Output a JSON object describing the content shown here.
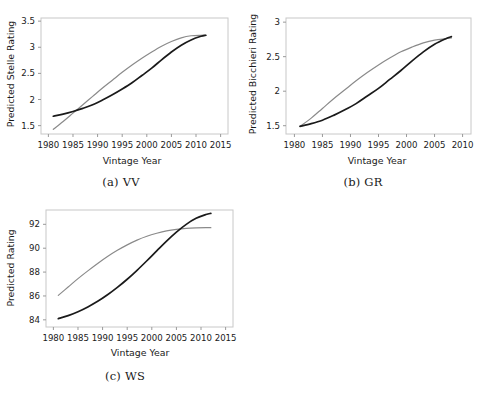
{
  "figure": {
    "panels": [
      {
        "id": "a",
        "caption": "(a) VV",
        "xlabel": "Vintage Year",
        "ylabel": "Predicted Stelle Rating"
      },
      {
        "id": "b",
        "caption": "(b) GR",
        "xlabel": "Vintage Year",
        "ylabel": "Predicted Bicchieri Rating"
      },
      {
        "id": "c",
        "caption": "(c) WS",
        "xlabel": "Vintage Year",
        "ylabel": "Predicted Rating"
      }
    ]
  },
  "colors": {
    "curve_dark": "#1a1a1a",
    "curve_gray": "#8a8a8a",
    "frame": "#c8c8c8",
    "text": "#1a1a1a",
    "background": "#ffffff"
  },
  "chart_data": [
    {
      "type": "line",
      "id": "a",
      "title": "(a) VV",
      "xlabel": "Vintage Year",
      "ylabel": "Predicted Stelle Rating",
      "xlim": [
        1978.5,
        2016.5
      ],
      "ylim": [
        1.34,
        3.56
      ],
      "xticks": [
        1980,
        1985,
        1990,
        1995,
        2000,
        2005,
        2010,
        2015
      ],
      "xticklabels": [
        "1980",
        "1985",
        "1990",
        "1995",
        "2000",
        "2005",
        "2010",
        "2015"
      ],
      "yticks": [
        1.5,
        2,
        2.5,
        3,
        3.5
      ],
      "yticklabels": [
        "1.5",
        "2",
        "2.5",
        "3",
        "3.5"
      ],
      "grid": false,
      "legend": "none",
      "series": [
        {
          "name": "gray-curve",
          "color": "#8a8a8a",
          "x": [
            1981,
            1983,
            1985,
            1987,
            1989,
            1991,
            1993,
            1995,
            1997,
            1999,
            2001,
            2003,
            2005,
            2007,
            2009,
            2011,
            2012
          ],
          "y": [
            1.43,
            1.58,
            1.74,
            1.9,
            2.06,
            2.22,
            2.37,
            2.52,
            2.66,
            2.79,
            2.91,
            3.02,
            3.11,
            3.18,
            3.22,
            3.23,
            3.23
          ]
        },
        {
          "name": "dark-curve",
          "color": "#1a1a1a",
          "x": [
            1981,
            1983,
            1985,
            1987,
            1989,
            1991,
            1993,
            1995,
            1997,
            1999,
            2001,
            2003,
            2005,
            2007,
            2009,
            2011,
            2012
          ],
          "y": [
            1.68,
            1.72,
            1.77,
            1.83,
            1.9,
            1.99,
            2.09,
            2.2,
            2.32,
            2.46,
            2.6,
            2.76,
            2.91,
            3.04,
            3.14,
            3.21,
            3.23
          ]
        }
      ]
    },
    {
      "type": "line",
      "id": "b",
      "title": "(b) GR",
      "xlabel": "Vintage Year",
      "ylabel": "Predicted Bicchieri Rating",
      "xlim": [
        1978.5,
        2011.5
      ],
      "ylim": [
        1.38,
        3.06
      ],
      "xticks": [
        1980,
        1985,
        1990,
        1995,
        2000,
        2005,
        2010
      ],
      "xticklabels": [
        "1980",
        "1985",
        "1990",
        "1995",
        "2000",
        "2005",
        "2010"
      ],
      "yticks": [
        1.5,
        2,
        2.5,
        3
      ],
      "yticklabels": [
        "1.5",
        "2",
        "2.5",
        "3"
      ],
      "grid": false,
      "legend": "none",
      "series": [
        {
          "name": "gray-curve",
          "color": "#8a8a8a",
          "x": [
            1981,
            1983,
            1985,
            1987,
            1989,
            1991,
            1993,
            1995,
            1997,
            1999,
            2001,
            2003,
            2005,
            2007,
            2008
          ],
          "y": [
            1.49,
            1.61,
            1.75,
            1.89,
            2.02,
            2.15,
            2.27,
            2.38,
            2.48,
            2.57,
            2.64,
            2.7,
            2.74,
            2.76,
            2.77
          ]
        },
        {
          "name": "dark-curve",
          "color": "#1a1a1a",
          "x": [
            1981,
            1983,
            1985,
            1987,
            1989,
            1991,
            1993,
            1995,
            1997,
            1999,
            2001,
            2003,
            2005,
            2007,
            2008
          ],
          "y": [
            1.49,
            1.53,
            1.58,
            1.65,
            1.73,
            1.82,
            1.93,
            2.04,
            2.17,
            2.3,
            2.44,
            2.57,
            2.68,
            2.76,
            2.79
          ]
        }
      ]
    },
    {
      "type": "line",
      "id": "c",
      "title": "(c) WS",
      "xlabel": "Vintage Year",
      "ylabel": "Predicted Rating",
      "xlim": [
        1978.5,
        2016.5
      ],
      "ylim": [
        83.4,
        93.2
      ],
      "xticks": [
        1980,
        1985,
        1990,
        1995,
        2000,
        2005,
        2010,
        2015
      ],
      "xticklabels": [
        "1980",
        "1985",
        "1990",
        "1995",
        "2000",
        "2005",
        "2010",
        "2015"
      ],
      "yticks": [
        84,
        86,
        88,
        90,
        92
      ],
      "yticklabels": [
        "84",
        "86",
        "88",
        "90",
        "92"
      ],
      "grid": false,
      "legend": "none",
      "series": [
        {
          "name": "gray-curve",
          "color": "#8a8a8a",
          "x": [
            1981,
            1983,
            1985,
            1987,
            1989,
            1991,
            1993,
            1995,
            1997,
            1999,
            2001,
            2003,
            2005,
            2007,
            2009,
            2011,
            2012
          ],
          "y": [
            86.05,
            86.75,
            87.45,
            88.1,
            88.72,
            89.3,
            89.82,
            90.28,
            90.68,
            91.0,
            91.25,
            91.45,
            91.58,
            91.66,
            91.7,
            91.72,
            91.72
          ]
        },
        {
          "name": "dark-curve",
          "color": "#1a1a1a",
          "x": [
            1981,
            1983,
            1985,
            1987,
            1989,
            1991,
            1993,
            1995,
            1997,
            1999,
            2001,
            2003,
            2005,
            2007,
            2009,
            2011,
            2012
          ],
          "y": [
            84.1,
            84.35,
            84.68,
            85.08,
            85.55,
            86.1,
            86.72,
            87.4,
            88.15,
            88.95,
            89.78,
            90.6,
            91.35,
            92.0,
            92.5,
            92.82,
            92.92
          ]
        }
      ]
    }
  ]
}
